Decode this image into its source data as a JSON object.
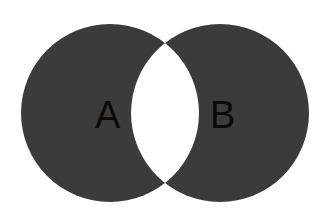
{
  "diagram": {
    "type": "venn",
    "sets": [
      {
        "id": "A",
        "label": "A",
        "cx": 110,
        "cy": 113,
        "r": 89
      },
      {
        "id": "B",
        "label": "B",
        "cx": 220,
        "cy": 113,
        "r": 89
      }
    ],
    "intersection": {
      "shaded": false
    },
    "colors": {
      "fill": "#3b3b3b",
      "intersection": "#ffffff",
      "background": "#ffffff",
      "label": "#0a0a0a"
    }
  }
}
